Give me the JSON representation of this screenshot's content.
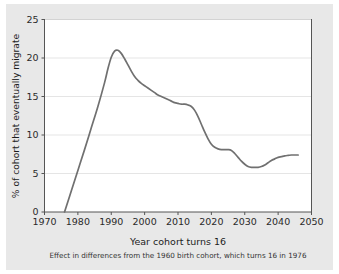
{
  "figure": {
    "background_color": "#e8e8e8",
    "plot_background_color": "#ffffff",
    "line_color": "#707070",
    "grid_color": "#e0e0e0",
    "axis_color": "#555555",
    "page_background_color": "#ffffff"
  },
  "chart_data": {
    "type": "line",
    "title": "",
    "xlabel": "Year cohort turns 16",
    "ylabel": "% of cohort that eventually migrate",
    "subtitle": "Effect in differences from the 1960 birth cohort, which turns 16 in 1976",
    "xlim": [
      1970,
      2050
    ],
    "ylim": [
      0,
      25
    ],
    "xticks": [
      1970,
      1980,
      1990,
      2000,
      2010,
      2020,
      2030,
      2040,
      2050
    ],
    "xtick_labels": [
      "1970",
      "1980",
      "1990",
      "2000",
      "2010",
      "2020",
      "2030",
      "2040",
      "2050"
    ],
    "yticks": [
      0,
      5,
      10,
      15,
      20,
      25
    ],
    "ytick_labels": [
      "0",
      "5",
      "10",
      "15",
      "20",
      "25"
    ],
    "grid": "horizontal",
    "legend": "none",
    "series": [
      {
        "name": "% of cohort that eventually migrate",
        "color": "#707070",
        "x": [
          1976,
          1978,
          1980,
          1982,
          1984,
          1986,
          1988,
          1989,
          1990,
          1991,
          1992,
          1993,
          1994,
          1995,
          1996,
          1997,
          1998,
          1999,
          2000,
          2001,
          2002,
          2003,
          2004,
          2005,
          2006,
          2007,
          2008,
          2009,
          2010,
          2011,
          2012,
          2013,
          2014,
          2015,
          2016,
          2017,
          2018,
          2019,
          2020,
          2021,
          2022,
          2023,
          2024,
          2025,
          2026,
          2027,
          2028,
          2029,
          2030,
          2031,
          2032,
          2033,
          2034,
          2035,
          2036,
          2037,
          2038,
          2039,
          2040,
          2041,
          2042,
          2043,
          2044,
          2045,
          2046
        ],
        "y": [
          0.0,
          2.7,
          5.4,
          8.1,
          10.9,
          13.7,
          16.8,
          18.6,
          20.1,
          20.9,
          21.0,
          20.6,
          19.9,
          19.1,
          18.3,
          17.6,
          17.1,
          16.7,
          16.4,
          16.1,
          15.8,
          15.5,
          15.2,
          15.0,
          14.8,
          14.6,
          14.4,
          14.2,
          14.1,
          14.0,
          14.0,
          13.9,
          13.7,
          13.2,
          12.4,
          11.4,
          10.4,
          9.5,
          8.8,
          8.4,
          8.2,
          8.1,
          8.1,
          8.1,
          8.0,
          7.6,
          7.1,
          6.6,
          6.2,
          5.9,
          5.8,
          5.8,
          5.8,
          5.9,
          6.1,
          6.4,
          6.7,
          6.9,
          7.1,
          7.2,
          7.3,
          7.35,
          7.4,
          7.4,
          7.4
        ]
      }
    ],
    "annotations": {
      "peak_year": 1992,
      "peak_value": 21.0,
      "zero_crossing_year": 1976,
      "trough_year": 2033,
      "trough_value": 5.8,
      "final_year": 2046,
      "final_value": 7.4
    }
  }
}
